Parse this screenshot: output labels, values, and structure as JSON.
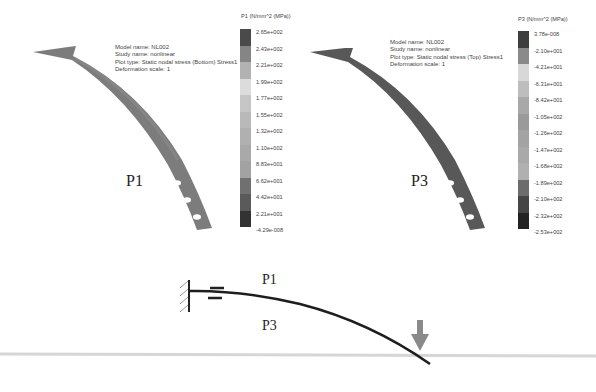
{
  "panels": [
    {
      "id": "P1",
      "label": "P1",
      "info": {
        "model": "Model name: NL002",
        "study": "Study name: nonlinear",
        "plot": "Plot type: Static nodal stress (Bottom) Stress1",
        "deformation": "Deformation scale: 1"
      },
      "legend": {
        "title": "P1 (N/mm^2 (MPa))",
        "ticks": [
          "2.65e+002",
          "2.43e+002",
          "2.21e+002",
          "1.99e+002",
          "1.77e+002",
          "1.55e+002",
          "1.32e+002",
          "1.10e+002",
          "8.83e+001",
          "6.62e+001",
          "4.42e+001",
          "2.21e+001",
          "-4.29e-008"
        ],
        "colors": [
          "#4a4a4a",
          "#858585",
          "#b2b2b2",
          "#dcdcdc",
          "#c6c6c6",
          "#b9b9b9",
          "#b0b0b0",
          "#a9a9a9",
          "#a2a2a2",
          "#707070",
          "#5a5a5a",
          "#333333"
        ]
      },
      "body_color": "#6e6e6e"
    },
    {
      "id": "P3",
      "label": "P3",
      "info": {
        "model": "Model name: NL002",
        "study": "Study name: nonlinear",
        "plot": "Plot type: Static nodal stress (Top) Stress1",
        "deformation": "Deformation scale: 1"
      },
      "legend": {
        "title": "P3 (N/mm^2 (MPa))",
        "ticks": [
          "3.78e-008",
          "-2.10e+001",
          "-4.21e+001",
          "-6.31e+001",
          "-8.42e+001",
          "-1.05e+002",
          "-1.26e+002",
          "-1.47e+002",
          "-1.68e+002",
          "-1.89e+002",
          "-2.10e+002",
          "-2.32e+002",
          "-2.53e+002"
        ],
        "colors": [
          "#3e3e3e",
          "#8a8a8a",
          "#d8d8d8",
          "#bdbdbd",
          "#a8a8a8",
          "#9a9a9a",
          "#a3a3a3",
          "#a9a9a9",
          "#b0b0b0",
          "#6c6c6c",
          "#454545",
          "#222222"
        ]
      },
      "body_color": "#4a4a4a"
    }
  ],
  "schematic": {
    "top_label": "P1",
    "bottom_label": "P3",
    "load_arrow_color": "#8a8a8a",
    "ground_line_color": "#d6d6d6",
    "beam_color": "#1e1e1e"
  }
}
